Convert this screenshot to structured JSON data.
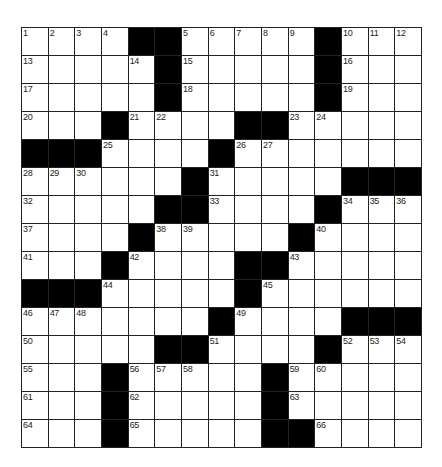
{
  "puzzle": {
    "rows": 15,
    "cols": 15,
    "block_color": "#000000",
    "cell_color": "#ffffff",
    "grid": [
      [
        "1",
        "2",
        "3",
        "4",
        "#",
        "#",
        "5",
        "6",
        "7",
        "8",
        "9",
        "#",
        "10",
        "11",
        "12"
      ],
      [
        "13",
        "",
        "",
        "",
        "14",
        "#",
        "15",
        "",
        "",
        "",
        "",
        "#",
        "16",
        "",
        ""
      ],
      [
        "17",
        "",
        "",
        "",
        "",
        "#",
        "18",
        "",
        "",
        "",
        "",
        "#",
        "19",
        "",
        ""
      ],
      [
        "20",
        "",
        "",
        "#",
        "21",
        "22",
        "",
        "",
        "#",
        "#",
        "23",
        "24",
        "",
        "",
        ""
      ],
      [
        "#",
        "#",
        "#",
        "25",
        "",
        "",
        "",
        "#",
        "26",
        "27",
        "",
        "",
        "",
        "",
        ""
      ],
      [
        "28",
        "29",
        "30",
        "",
        "",
        "",
        "#",
        "31",
        "",
        "",
        "",
        "",
        "#",
        "#",
        "#"
      ],
      [
        "32",
        "",
        "",
        "",
        "",
        "#",
        "#",
        "33",
        "",
        "",
        "",
        "#",
        "34",
        "35",
        "36"
      ],
      [
        "37",
        "",
        "",
        "",
        "#",
        "38",
        "39",
        "",
        "",
        "",
        "#",
        "40",
        "",
        "",
        ""
      ],
      [
        "41",
        "",
        "",
        "#",
        "42",
        "",
        "",
        "",
        "#",
        "#",
        "43",
        "",
        "",
        "",
        ""
      ],
      [
        "#",
        "#",
        "#",
        "44",
        "",
        "",
        "",
        "",
        "#",
        "45",
        "",
        "",
        "",
        "",
        ""
      ],
      [
        "46",
        "47",
        "48",
        "",
        "",
        "",
        "",
        "#",
        "49",
        "",
        "",
        "",
        "#",
        "#",
        "#"
      ],
      [
        "50",
        "",
        "",
        "",
        "",
        "#",
        "#",
        "51",
        "",
        "",
        "",
        "#",
        "52",
        "53",
        "54"
      ],
      [
        "55",
        "",
        "",
        "#",
        "56",
        "57",
        "58",
        "",
        "",
        "#",
        "59",
        "60",
        "",
        "",
        ""
      ],
      [
        "61",
        "",
        "",
        "#",
        "62",
        "",
        "",
        "",
        "",
        "#",
        "63",
        "",
        "",
        "",
        ""
      ],
      [
        "64",
        "",
        "",
        "#",
        "65",
        "",
        "",
        "",
        "",
        "#",
        "#",
        "66",
        "",
        "",
        ""
      ]
    ]
  }
}
